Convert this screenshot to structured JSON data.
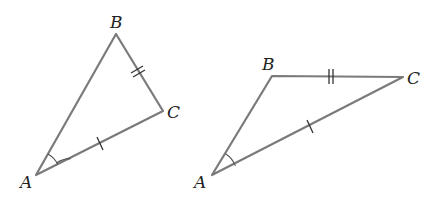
{
  "figure": {
    "colors": {
      "edge": "#7a7a7a",
      "tick": "#333333",
      "label": "#222222"
    }
  },
  "triangles": [
    {
      "id": "left",
      "vertices": {
        "A": {
          "label": "A",
          "x": 36,
          "y": 175
        },
        "B": {
          "label": "B",
          "x": 116,
          "y": 34
        },
        "C": {
          "label": "C",
          "x": 163,
          "y": 111
        }
      },
      "marks": {
        "AC": "single-tick",
        "BC": "double-tick",
        "angle_A": "arc"
      }
    },
    {
      "id": "right",
      "vertices": {
        "A": {
          "label": "A",
          "x": 212,
          "y": 175
        },
        "B": {
          "label": "B",
          "x": 272,
          "y": 76
        },
        "C": {
          "label": "C",
          "x": 403,
          "y": 77
        }
      },
      "marks": {
        "AC": "single-tick",
        "BC": "double-tick",
        "angle_A": "arc"
      }
    }
  ]
}
